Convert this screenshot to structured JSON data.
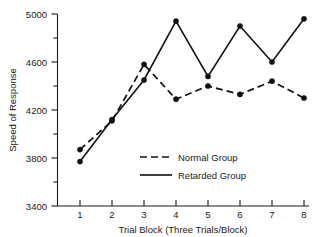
{
  "chart_data": {
    "type": "line",
    "title": "",
    "xlabel": "Trial Block (Three Trials/Block)",
    "ylabel": "Speed of Response",
    "x": [
      1,
      2,
      3,
      4,
      5,
      6,
      7,
      8
    ],
    "categories": [
      "1",
      "2",
      "3",
      "4",
      "5",
      "6",
      "7",
      "8"
    ],
    "xlim": [
      0.6,
      8.4
    ],
    "ylim": [
      3400,
      5000
    ],
    "yticks": [
      3400,
      3800,
      4200,
      4600,
      5000
    ],
    "yticklabels": [
      "3400",
      "3800",
      "4200",
      "4600",
      "5000"
    ],
    "yminorticks": [
      3600,
      4000,
      4400,
      4800
    ],
    "grid": false,
    "legend_position": "center",
    "series": [
      {
        "name": "Normal Group",
        "style": "dashed",
        "marker": "filled-circle",
        "color": "#111111",
        "values": [
          3870,
          4110,
          4580,
          4290,
          4400,
          4330,
          4440,
          4300
        ]
      },
      {
        "name": "Retarded Group",
        "style": "solid",
        "marker": "filled-circle",
        "color": "#111111",
        "values": [
          3770,
          4120,
          4450,
          4940,
          4480,
          4900,
          4600,
          4960
        ]
      }
    ]
  },
  "axes": {
    "y_axis_title": "Speed of Response",
    "x_axis_title": "Trial Block (Three Trials/Block)",
    "y_tick_labels": [
      "5000",
      "4600",
      "4200",
      "3800",
      "3400"
    ],
    "x_tick_labels": [
      "1",
      "2",
      "3",
      "4",
      "5",
      "6",
      "7",
      "8"
    ]
  },
  "legend": {
    "entries": [
      {
        "label": "Normal Group",
        "style": "dashed"
      },
      {
        "label": "Retarded Group",
        "style": "solid"
      }
    ]
  }
}
